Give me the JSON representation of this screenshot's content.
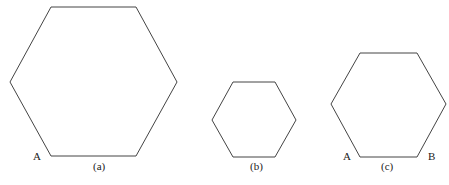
{
  "figure": {
    "hexagons": [
      {
        "id": "a",
        "caption": "(a)",
        "points": "51,7 136,7 177,82 136,156 51,156 10,82",
        "caption_pos": [
          93,
          170
        ],
        "vertex_labels": [
          {
            "text": "A",
            "pos": [
              33,
              160
            ]
          }
        ]
      },
      {
        "id": "b",
        "caption": "(b)",
        "points": "233,82 275,82 296,120 275,157 233,157 212,120",
        "caption_pos": [
          250,
          170
        ],
        "vertex_labels": []
      },
      {
        "id": "c",
        "caption": "(c)",
        "points": "360,53 417,53 446,104 417,157 360,157 331,104",
        "caption_pos": [
          381,
          170
        ],
        "vertex_labels": [
          {
            "text": "A",
            "pos": [
              343,
              160
            ]
          },
          {
            "text": "B",
            "pos": [
              428,
              160
            ]
          }
        ]
      }
    ],
    "stroke_color": "#444444",
    "background": "#ffffff"
  }
}
